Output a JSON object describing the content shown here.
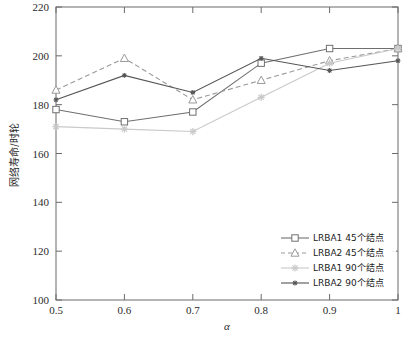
{
  "chart_data": {
    "type": "line",
    "title": "",
    "xlabel": "α",
    "ylabel": "网络寿命/时轮",
    "x": [
      0.5,
      0.6,
      0.7,
      0.8,
      0.9,
      1.0
    ],
    "xtick_labels": [
      "0.5",
      "0.6",
      "0.7",
      "0.8",
      "0.9",
      "1"
    ],
    "ytick_labels": [
      "100",
      "120",
      "140",
      "160",
      "180",
      "200",
      "220"
    ],
    "ytick_values": [
      100,
      120,
      140,
      160,
      180,
      200,
      220
    ],
    "xlim": [
      0.5,
      1.0
    ],
    "ylim": [
      100,
      220
    ],
    "grid": false,
    "legend_position": "lower right",
    "series": [
      {
        "name": "LRBA1 45个结点",
        "values": [
          178,
          173,
          177,
          197,
          203,
          203
        ],
        "color": "#6f6f6f",
        "marker": "square-open",
        "dash": "solid"
      },
      {
        "name": "LRBA2 45个结点",
        "values": [
          186,
          199,
          182,
          190,
          198,
          203
        ],
        "color": "#9a9a9a",
        "marker": "triangle-open",
        "dash": "dashed"
      },
      {
        "name": "LRBA1 90个结点",
        "values": [
          171,
          170,
          169,
          183,
          197,
          203
        ],
        "color": "#c9c9c9",
        "marker": "star",
        "dash": "solid"
      },
      {
        "name": "LRBA2 90个结点",
        "values": [
          182,
          192,
          185,
          199,
          194,
          198
        ],
        "color": "#555555",
        "marker": "star-small",
        "dash": "solid"
      }
    ]
  },
  "legend": {
    "entries": [
      {
        "label": "LRBA1 45个结点"
      },
      {
        "label": "LRBA2 45个结点"
      },
      {
        "label": "LRBA1 90个结点"
      },
      {
        "label": "LRBA2 90个结点"
      }
    ]
  },
  "axes": {
    "x_title": "α",
    "y_title": "网络寿命/时轮"
  }
}
